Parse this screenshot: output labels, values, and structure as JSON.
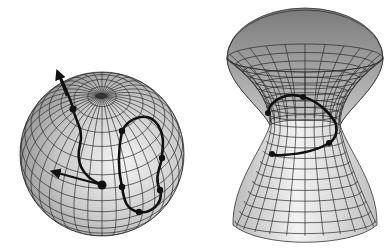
{
  "figure": {
    "panels": [
      {
        "name": "sphere",
        "surface": "sphere",
        "description": "Wireframe sphere with latitude/longitude mesh, one open curve with arrows and one closed loop curve",
        "center": [
          102,
          154
        ],
        "radius": 82,
        "pole": [
          101,
          96
        ],
        "open_curve": {
          "points": [
            [
              58,
              72
            ],
            [
              73,
              109
            ],
            [
              80,
              160
            ],
            [
              102,
              185
            ]
          ],
          "dots": [
            [
              73,
              109
            ],
            [
              102,
              185
            ]
          ],
          "arrows": [
            {
              "from": [
                73,
                109
              ],
              "to": [
                58,
                72
              ]
            },
            {
              "from": [
                102,
                185
              ],
              "to": [
                52,
                171
              ]
            }
          ]
        },
        "closed_curve": {
          "dots": [
            [
              122,
              131
            ],
            [
              162,
              158
            ],
            [
              160,
              190
            ],
            [
              122,
              187
            ],
            [
              139,
              212
            ]
          ]
        }
      },
      {
        "name": "hyperboloid",
        "surface": "hyperboloid",
        "description": "Wireframe one-sheet hyperboloid (hourglass) with closed curve wrapping around the waist",
        "top_center": [
          305,
          58
        ],
        "top_rx": 78,
        "waist_center": [
          305,
          125
        ],
        "waist_rx": 35,
        "bottom_center": [
          305,
          225
        ],
        "bottom_rx": 72,
        "closed_curve": {
          "dots": [
            [
              268,
              113
            ],
            [
              303,
              97
            ],
            [
              329,
              143
            ],
            [
              272,
              154
            ]
          ]
        }
      }
    ],
    "colors": {
      "background": "#ffffff",
      "mesh": "#2a2a2a",
      "curve": "#111111",
      "surface_light": "#eeeeee",
      "surface_dark": "#8a8a8a"
    }
  }
}
